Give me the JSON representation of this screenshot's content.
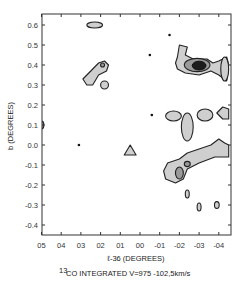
{
  "chart_data": {
    "type": "contour",
    "title": "",
    "xlabel": "ℓ-36 (DEGREES)",
    "ylabel": "b (DEGREES)",
    "caption_super": "13",
    "caption": "CO  INTEGRATED  V= 97.5 - 102.5 km/s",
    "caption_display": "CO INTEGRATED V=975 -102,5km/s",
    "xlim": [
      0.5,
      -0.45
    ],
    "ylim": [
      -0.45,
      0.65
    ],
    "xticks": [
      0.5,
      0.4,
      0.3,
      0.2,
      0.1,
      0.0,
      -0.1,
      -0.2,
      -0.3,
      -0.4
    ],
    "xtick_labels": [
      "05",
      "04",
      "03",
      "02",
      "01",
      "00",
      "-01",
      "-02",
      "-03",
      "-04"
    ],
    "yticks": [
      0.6,
      0.5,
      0.4,
      0.3,
      0.2,
      0.1,
      0.0,
      -0.1,
      -0.2,
      -0.3,
      -0.4
    ],
    "ytick_labels": [
      "0.6",
      "0.5",
      "0.4",
      "0.3",
      "0.2",
      "0.1",
      "0.0",
      "-0.1",
      "-0.2",
      "-0.3",
      "-0.4"
    ],
    "contour_levels": [
      "low",
      "mid",
      "high"
    ],
    "features": [
      {
        "name": "cloud-top-left",
        "level": 1,
        "l": 0.23,
        "b": 0.6,
        "rl": 0.04,
        "rb": 0.015
      },
      {
        "name": "cloud-fish",
        "level": 1,
        "l": 0.22,
        "b": 0.36,
        "rl": 0.07,
        "rb": 0.06
      },
      {
        "name": "cloud-fish-core",
        "level": 2,
        "l": 0.19,
        "b": 0.4,
        "rl": 0.01,
        "rb": 0.01
      },
      {
        "name": "cloud-small-circle",
        "level": 1,
        "l": 0.18,
        "b": 0.3,
        "rl": 0.02,
        "rb": 0.02
      },
      {
        "name": "cloud-main-peak",
        "level": 1,
        "l": -0.28,
        "b": 0.4,
        "rl": 0.1,
        "rb": 0.05
      },
      {
        "name": "cloud-main-mid",
        "level": 2,
        "l": -0.29,
        "b": 0.4,
        "rl": 0.065,
        "rb": 0.033
      },
      {
        "name": "cloud-main-core",
        "level": 3,
        "l": -0.3,
        "b": 0.397,
        "rl": 0.035,
        "rb": 0.022
      },
      {
        "name": "cloud-right-edge-upper",
        "level": 1,
        "l": -0.43,
        "b": 0.38,
        "rl": 0.02,
        "rb": 0.06
      },
      {
        "name": "cloud-left-edge",
        "level": 2,
        "l": 0.5,
        "b": 0.1,
        "rl": 0.012,
        "rb": 0.02
      },
      {
        "name": "cloud-blob-1",
        "level": 1,
        "l": -0.17,
        "b": 0.145,
        "rl": 0.04,
        "rb": 0.025
      },
      {
        "name": "cloud-blob-2",
        "level": 1,
        "l": -0.24,
        "b": 0.09,
        "rl": 0.03,
        "rb": 0.07
      },
      {
        "name": "cloud-blob-3",
        "level": 1,
        "l": -0.33,
        "b": 0.15,
        "rl": 0.04,
        "rb": 0.03
      },
      {
        "name": "cloud-blob-4",
        "level": 1,
        "l": -0.42,
        "b": 0.16,
        "rl": 0.03,
        "rb": 0.03
      },
      {
        "name": "cloud-triangle",
        "level": 1,
        "l": 0.05,
        "b": -0.02,
        "rl": 0.03,
        "rb": 0.03
      },
      {
        "name": "cloud-ridge",
        "level": 1,
        "l": -0.27,
        "b": -0.09,
        "rl": 0.2,
        "rb": 0.08
      },
      {
        "name": "cloud-ridge-core-1",
        "level": 2,
        "l": -0.2,
        "b": -0.14,
        "rl": 0.02,
        "rb": 0.03
      },
      {
        "name": "cloud-ridge-core-2",
        "level": 2,
        "l": -0.24,
        "b": -0.095,
        "rl": 0.015,
        "rb": 0.013
      },
      {
        "name": "cloud-small-1",
        "level": 1,
        "l": -0.24,
        "b": -0.245,
        "rl": 0.01,
        "rb": 0.02
      },
      {
        "name": "cloud-small-2",
        "level": 1,
        "l": -0.3,
        "b": -0.31,
        "rl": 0.01,
        "rb": 0.02
      },
      {
        "name": "cloud-small-3",
        "level": 1,
        "l": -0.39,
        "b": -0.3,
        "rl": 0.012,
        "rb": 0.017
      }
    ],
    "points": [
      {
        "l": -0.05,
        "b": 0.45
      },
      {
        "l": -0.15,
        "b": 0.55
      },
      {
        "l": -0.06,
        "b": 0.15
      },
      {
        "l": 0.31,
        "b": 0.0
      }
    ]
  }
}
